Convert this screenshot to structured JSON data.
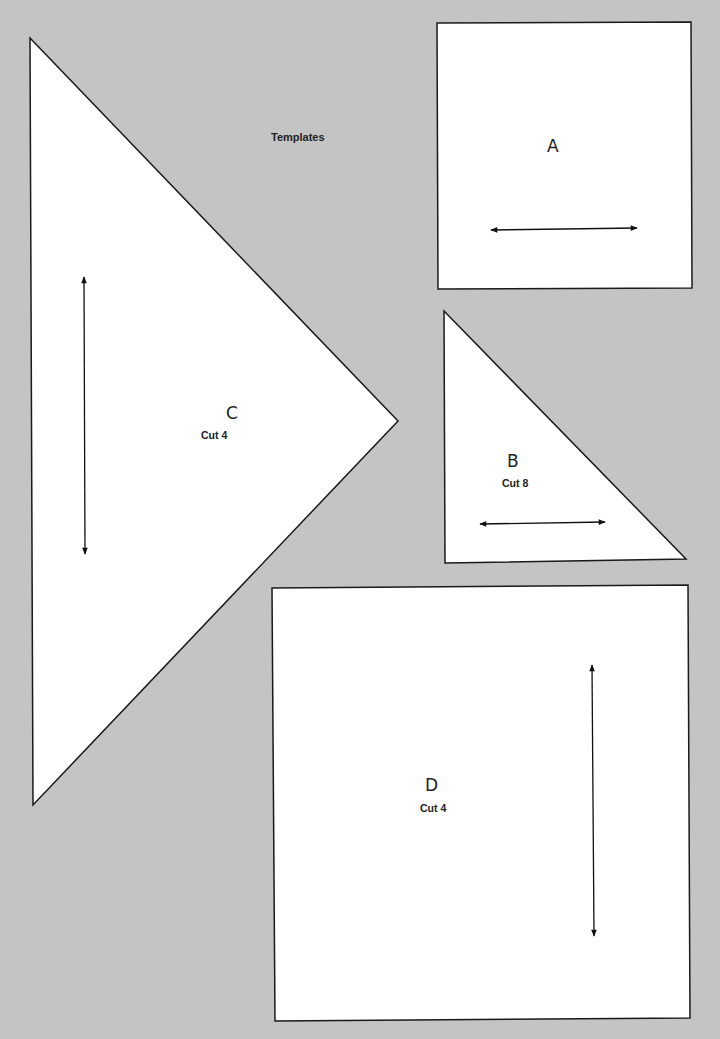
{
  "page": {
    "title": "Templates",
    "background_color": "#c4c4c4",
    "template_fill": "#ffffff",
    "line_color": "#1a1a1a"
  },
  "templates": [
    {
      "id": "A",
      "label": "A",
      "cut": null,
      "shape": "square",
      "grainline": "horizontal"
    },
    {
      "id": "B",
      "label": "B",
      "cut": "Cut 8",
      "shape": "right-triangle",
      "grainline": "horizontal"
    },
    {
      "id": "C",
      "label": "C",
      "cut": "Cut 4",
      "shape": "triangle",
      "grainline": "vertical"
    },
    {
      "id": "D",
      "label": "D",
      "cut": "Cut 4",
      "shape": "square",
      "grainline": "vertical"
    }
  ]
}
